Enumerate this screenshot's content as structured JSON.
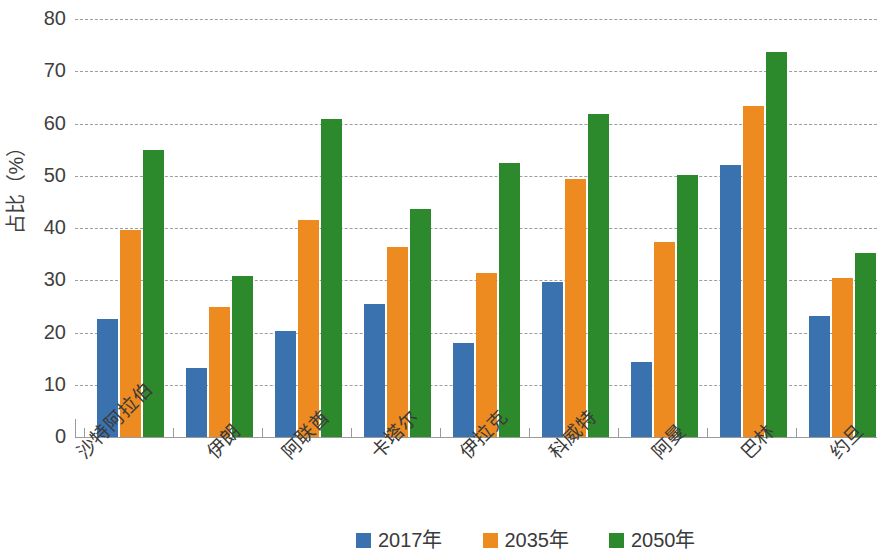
{
  "chart_data": {
    "type": "bar",
    "title": "",
    "subtitle": "",
    "xlabel": "",
    "ylabel": "占比（%）",
    "ylim": [
      0,
      80
    ],
    "ytick_step": 10,
    "yticks": [
      "0",
      "10",
      "20",
      "30",
      "40",
      "50",
      "60",
      "70",
      "80"
    ],
    "grid": true,
    "legend_position": "bottom-center",
    "categories": [
      "沙特阿拉伯",
      "伊朗",
      "阿联酋",
      "卡塔尔",
      "伊拉克",
      "科威特",
      "阿曼",
      "巴林",
      "约旦"
    ],
    "series": [
      {
        "name": "2017年",
        "color": "#3a72b0",
        "values": [
          22.5,
          13.2,
          20.3,
          25.5,
          18.0,
          29.7,
          14.4,
          52.0,
          23.1
        ]
      },
      {
        "name": "2035年",
        "color": "#ed8b20",
        "values": [
          39.6,
          24.9,
          41.5,
          36.3,
          31.4,
          49.4,
          37.4,
          63.4,
          30.4
        ]
      },
      {
        "name": "2050年",
        "color": "#2c8a2c",
        "values": [
          54.9,
          30.9,
          60.9,
          43.6,
          52.4,
          61.8,
          50.1,
          73.6,
          35.2
        ]
      }
    ]
  },
  "legend": {
    "items": [
      {
        "label": "2017年",
        "color": "#3a72b0"
      },
      {
        "label": "2035年",
        "color": "#ed8b20"
      },
      {
        "label": "2050年",
        "color": "#2c8a2c"
      }
    ]
  }
}
